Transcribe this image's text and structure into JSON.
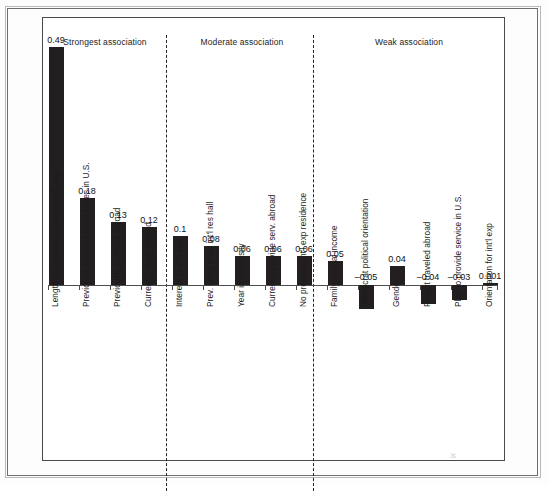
{
  "chart_data": {
    "type": "bar",
    "title": "",
    "xlabel": "",
    "ylabel": "",
    "ylim": [
      -0.06,
      0.52
    ],
    "grid": false,
    "legend": "none",
    "orientation": "vertical",
    "bar_color": "#231f20",
    "categories": [
      "Length of previous & current int'l exp",
      "Previously traveled to >5 states in U.S.",
      "Previously traveled abroad",
      "Currently study abroad",
      "Interest in int'l exp",
      "Prev. living in an int'l res hall",
      "Year in university",
      "Currently provide serv. abroad",
      "No previous int'l exp residence",
      "Family annual income",
      "Democrat political orientation",
      "Gender",
      "Parent traveled abroad",
      "Plan to provide service in U.S.",
      "Orientation for int'l exp"
    ],
    "values": [
      0.49,
      0.18,
      0.13,
      0.12,
      0.1,
      0.08,
      0.06,
      0.06,
      0.06,
      0.05,
      -0.05,
      0.04,
      -0.04,
      -0.03,
      0.001
    ],
    "value_labels": [
      "0.49",
      "0.18",
      "0.13",
      "0.12",
      "0.1",
      "0.08",
      "0.06",
      "0.06",
      "0.06",
      "0.05",
      "–0.05",
      "0.04",
      "–0.04",
      "–0.03",
      "0.001"
    ],
    "groups": [
      {
        "label": "Strongest association",
        "start_index": 0,
        "end_index": 3
      },
      {
        "label": "Moderate association",
        "start_index": 4,
        "end_index": 8
      },
      {
        "label": "Weak association",
        "start_index": 9,
        "end_index": 14
      }
    ]
  },
  "panel": {
    "headers": [
      "Strongest association",
      "Moderate association",
      "Weak association"
    ]
  }
}
